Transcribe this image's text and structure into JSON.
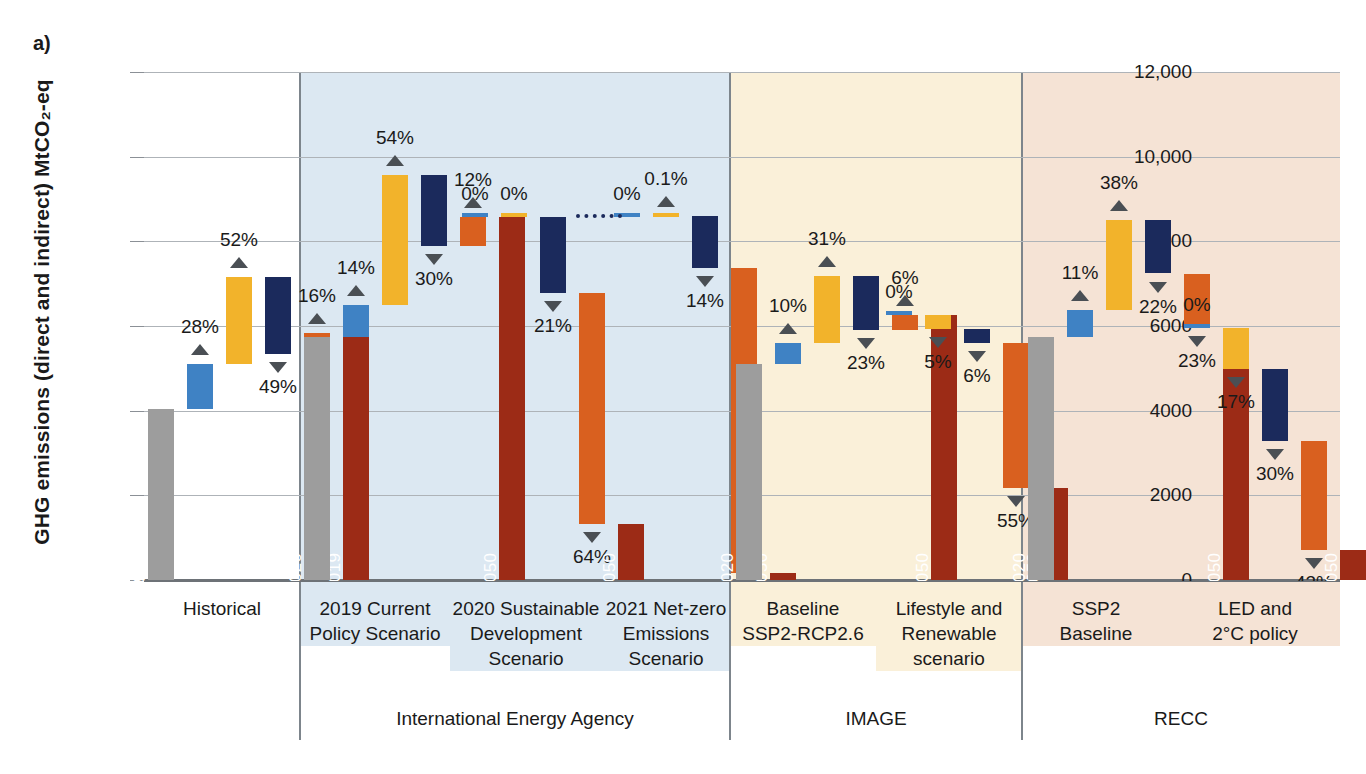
{
  "figure": {
    "panel_letter": "a)",
    "y_axis_title": "GHG emissions (direct and indirect) MtCO₂-eq"
  },
  "chart_data": {
    "type": "bar",
    "subtitle": "",
    "xlabel": "",
    "ylabel": "GHG emissions (direct and indirect) MtCO2-eq",
    "ylim": [
      0,
      12000
    ],
    "yticks": [
      0,
      2000,
      4000,
      6000,
      8000,
      10000,
      12000
    ],
    "ytick_labels": [
      "0",
      "2000",
      "4000",
      "6000",
      "8000",
      "10,000",
      "12,000"
    ],
    "grid": true,
    "legend_position": "none",
    "colors": {
      "gray_base": "#9d9d9d",
      "blue_population": "#3f82c4",
      "yellow_affluence": "#f2b32b",
      "navy_material": "#1b2a5c",
      "orange_energy": "#d9601f",
      "darkred_total": "#9c2b16"
    },
    "groups": [
      {
        "name": "Historical",
        "band_color": "#ffffff",
        "scenarios": [
          {
            "label": "Historical",
            "start_bar": {
              "year": "1990",
              "value": 4050,
              "color": "gray_base"
            },
            "end_bar": {
              "year": "2019",
              "value": 5830,
              "color": "darkred_total"
            },
            "steps": [
              {
                "driver": "population",
                "pct": "28%",
                "direction": "up",
                "from": 4050,
                "to": 5110,
                "color": "blue_population"
              },
              {
                "driver": "affluence",
                "pct": "52%",
                "direction": "up",
                "from": 5110,
                "to": 7150,
                "color": "yellow_affluence"
              },
              {
                "driver": "material-intensity",
                "pct": "49%",
                "direction": "down",
                "from": 7150,
                "to": 5350,
                "color": "navy_material"
              },
              {
                "driver": "energy-emission-intensity",
                "pct": "16%",
                "direction": "up",
                "from": 5350,
                "to": 5830,
                "color": "orange_energy"
              }
            ]
          }
        ]
      },
      {
        "name": "International Energy Agency",
        "band_color": "#dce8f2",
        "scenarios": [
          {
            "label": "2019 Current Policy Scenario",
            "start_bar": {
              "year": "2020",
              "value": 5740,
              "color": "gray_base"
            },
            "end_bar": {
              "year": "2050",
              "value": 8580,
              "color": "darkred_total"
            },
            "steps": [
              {
                "driver": "population",
                "pct": "14%",
                "direction": "up",
                "from": 5740,
                "to": 6500,
                "color": "blue_population"
              },
              {
                "driver": "affluence",
                "pct": "54%",
                "direction": "up",
                "from": 6500,
                "to": 9560,
                "color": "yellow_affluence"
              },
              {
                "driver": "material-intensity",
                "pct": "30%",
                "direction": "down",
                "from": 9560,
                "to": 7880,
                "color": "navy_material"
              },
              {
                "driver": "energy-emission-intensity",
                "pct": "12%",
                "direction": "up",
                "from": 7880,
                "to": 8580,
                "color": "orange_energy"
              }
            ]
          },
          {
            "label": "2020 Sustainable Development Scenario",
            "start_bar": {
              "year": "",
              "value": 8580,
              "color": "none"
            },
            "end_bar": {
              "year": "2050",
              "value": 1330,
              "color": "darkred_total"
            },
            "steps": [
              {
                "driver": "population",
                "pct": "0%",
                "direction": "flat",
                "from": 8580,
                "to": 8580,
                "color": "blue_population"
              },
              {
                "driver": "affluence",
                "pct": "0%",
                "direction": "flat",
                "from": 8580,
                "to": 8580,
                "color": "yellow_affluence"
              },
              {
                "driver": "material-intensity",
                "pct": "21%",
                "direction": "down",
                "from": 8580,
                "to": 6780,
                "color": "navy_material"
              },
              {
                "driver": "energy-emission-intensity",
                "pct": "64%",
                "direction": "down",
                "from": 6780,
                "to": 1330,
                "color": "orange_energy"
              }
            ]
          },
          {
            "label": "2021 Net-zero Emissions Scenario",
            "start_bar": {
              "year": "",
              "value": 8580,
              "color": "none"
            },
            "end_bar": {
              "year": "2050",
              "value": 170,
              "color": "darkred_total"
            },
            "steps": [
              {
                "driver": "population",
                "pct": "0%",
                "direction": "flat",
                "from": 8580,
                "to": 8580,
                "color": "blue_population"
              },
              {
                "driver": "affluence",
                "pct": "0.1%",
                "direction": "up",
                "from": 8580,
                "to": 8590,
                "color": "yellow_affluence"
              },
              {
                "driver": "material-intensity",
                "pct": "14%",
                "direction": "down",
                "from": 8590,
                "to": 7380,
                "color": "navy_material"
              },
              {
                "driver": "energy-emission-intensity",
                "pct": "85%",
                "direction": "down",
                "from": 7380,
                "to": 170,
                "color": "orange_energy"
              }
            ]
          }
        ]
      },
      {
        "name": "IMAGE",
        "band_color": "#faf0d9",
        "scenarios": [
          {
            "label": "Baseline SSP2-RCP2.6",
            "start_bar": {
              "year": "2020",
              "value": 5110,
              "color": "gray_base"
            },
            "end_bar": {
              "year": "2050",
              "value": 6250,
              "color": "darkred_total"
            },
            "steps": [
              {
                "driver": "population",
                "pct": "10%",
                "direction": "up",
                "from": 5110,
                "to": 5610,
                "color": "blue_population"
              },
              {
                "driver": "affluence",
                "pct": "31%",
                "direction": "up",
                "from": 5610,
                "to": 7170,
                "color": "yellow_affluence"
              },
              {
                "driver": "material-intensity",
                "pct": "23%",
                "direction": "down",
                "from": 7170,
                "to": 5910,
                "color": "navy_material"
              },
              {
                "driver": "energy-emission-intensity",
                "pct": "6%",
                "direction": "up",
                "from": 5910,
                "to": 6250,
                "color": "orange_energy"
              }
            ]
          },
          {
            "label": "Lifestyle and Renewable scenario",
            "start_bar": {
              "year": "",
              "value": 6250,
              "color": "none"
            },
            "end_bar": {
              "year": "2050",
              "value": 2180,
              "color": "darkred_total"
            },
            "steps": [
              {
                "driver": "population",
                "pct": "0%",
                "direction": "flat",
                "from": 6250,
                "to": 6250,
                "color": "blue_population"
              },
              {
                "driver": "affluence",
                "pct": "5%",
                "direction": "down",
                "from": 6250,
                "to": 5940,
                "color": "yellow_affluence"
              },
              {
                "driver": "material-intensity",
                "pct": "6%",
                "direction": "down",
                "from": 5940,
                "to": 5590,
                "color": "navy_material"
              },
              {
                "driver": "energy-emission-intensity",
                "pct": "55%",
                "direction": "down",
                "from": 5590,
                "to": 2180,
                "color": "orange_energy"
              }
            ]
          }
        ]
      },
      {
        "name": "RECC",
        "band_color": "#f5e3d5",
        "scenarios": [
          {
            "label": "SSP2 Baseline",
            "start_bar": {
              "year": "2020",
              "value": 5740,
              "color": "gray_base"
            },
            "end_bar": {
              "year": "2050",
              "value": 5960,
              "color": "darkred_total"
            },
            "steps": [
              {
                "driver": "population",
                "pct": "11%",
                "direction": "up",
                "from": 5740,
                "to": 6370,
                "color": "blue_population"
              },
              {
                "driver": "affluence",
                "pct": "38%",
                "direction": "up",
                "from": 6370,
                "to": 8500,
                "color": "yellow_affluence"
              },
              {
                "driver": "material-intensity",
                "pct": "22%",
                "direction": "down",
                "from": 8500,
                "to": 7240,
                "color": "navy_material"
              },
              {
                "driver": "energy-emission-intensity",
                "pct": "23%",
                "direction": "down",
                "from": 7240,
                "to": 5960,
                "color": "orange_energy"
              }
            ]
          },
          {
            "label": "LED and 2°C policy",
            "start_bar": {
              "year": "",
              "value": 5960,
              "color": "none"
            },
            "end_bar": {
              "year": "2050",
              "value": 700,
              "color": "darkred_total"
            },
            "steps": [
              {
                "driver": "population",
                "pct": "0%",
                "direction": "flat",
                "from": 5960,
                "to": 5960,
                "color": "blue_population"
              },
              {
                "driver": "affluence",
                "pct": "17%",
                "direction": "down",
                "from": 5960,
                "to": 4990,
                "color": "yellow_affluence"
              },
              {
                "driver": "material-intensity",
                "pct": "30%",
                "direction": "down",
                "from": 4990,
                "to": 3280,
                "color": "navy_material"
              },
              {
                "driver": "energy-emission-intensity",
                "pct": "43%",
                "direction": "down",
                "from": 3280,
                "to": 700,
                "color": "orange_energy"
              }
            ]
          }
        ]
      }
    ]
  },
  "axis": {
    "ticks": [
      "12,000",
      "10,000",
      "8000",
      "6000",
      "4000",
      "2000",
      "0"
    ]
  },
  "scenario_labels": [
    {
      "text": "Historical",
      "lines": [
        "Historical"
      ]
    },
    {
      "text": "2019 Current Policy Scenario",
      "lines": [
        "2019 Current",
        "Policy Scenario"
      ]
    },
    {
      "text": "2020 Sustainable Development Scenario",
      "lines": [
        "2020 Sustainable",
        "Development",
        "Scenario"
      ]
    },
    {
      "text": "2021 Net-zero Emissions Scenario",
      "lines": [
        "2021 Net-zero",
        "Emissions",
        "Scenario"
      ]
    },
    {
      "text": "Baseline SSP2-RCP2.6",
      "lines": [
        "Baseline",
        "SSP2-RCP2.6"
      ]
    },
    {
      "text": "Lifestyle and Renewable scenario",
      "lines": [
        "Lifestyle and",
        "Renewable",
        "scenario"
      ]
    },
    {
      "text": "SSP2 Baseline",
      "lines": [
        "SSP2",
        "Baseline"
      ]
    },
    {
      "text": "LED and 2°C policy",
      "lines": [
        "LED and",
        "2°C policy"
      ]
    }
  ],
  "group_labels": [
    "",
    "International Energy Agency",
    "IMAGE",
    "RECC"
  ]
}
